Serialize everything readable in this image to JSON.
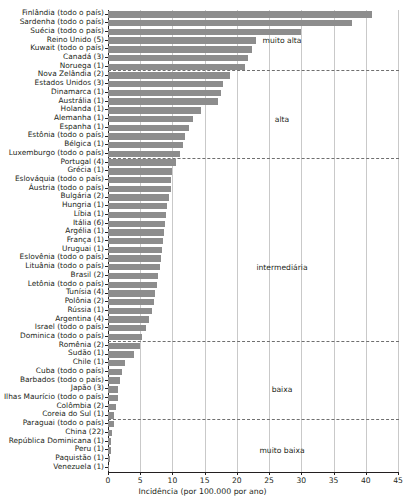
{
  "chart_data": {
    "type": "bar",
    "orientation": "horizontal",
    "title": "",
    "xlabel": "Incidência (por 100.000 por ano)",
    "ylabel": "",
    "xlim": [
      0,
      45
    ],
    "xticks": [
      0,
      5,
      10,
      15,
      20,
      25,
      30,
      35,
      40,
      45
    ],
    "grid": true,
    "legend": false,
    "bar_color": "#8d8d8d",
    "categories": [
      "Finlândia (todo o país)",
      "Sardenha (todo o país)",
      "Suécia (todo o país)",
      "Reino Unido (5)",
      "Kuwait (todo o país)",
      "Canadá (3)",
      "Noruega (1)",
      "Nova Zelândia (2)",
      "Estados Unidos (3)",
      "Dinamarca (1)",
      "Austrália (1)",
      "Holanda (1)",
      "Alemanha (1)",
      "Espanha (1)",
      "Estônia (todo o país)",
      "Bélgica (1)",
      "Luxemburgo (todo o país)",
      "Portugal (4)",
      "Grécia (1)",
      "Eslováquia (todo o país)",
      "Áustria (todo o país)",
      "Bulgária (2)",
      "Hungria (1)",
      "Líbia (1)",
      "Itália (6)",
      "Argélia (1)",
      "França (1)",
      "Uruguai (1)",
      "Eslovênia (todo o país)",
      "Lituânia (todo o país)",
      "Brasil (2)",
      "Letônia (todo o país)",
      "Tunísia (4)",
      "Polônia (2)",
      "Rússia (1)",
      "Argentina (4)",
      "Israel (todo o país)",
      "Dominica (todo o país)",
      "Romênia (2)",
      "Sudão (1)",
      "Chile (1)",
      "Cuba (todo o país)",
      "Barbados (todo o país)",
      "Japão (3)",
      "Ilhas Maurício (todo o país)",
      "Colômbia (2)",
      "Coreia do Sul (1)",
      "Paraguai (todo o país)",
      "China (22)",
      "República Dominicana (1)",
      "Peru (1)",
      "Paquistão (1)",
      "Venezuela (1)"
    ],
    "values": [
      40.9,
      37.8,
      30.0,
      22.9,
      22.3,
      21.7,
      21.2,
      19.0,
      17.8,
      17.6,
      17.0,
      14.4,
      13.2,
      12.5,
      11.9,
      11.6,
      11.2,
      10.6,
      10.0,
      9.8,
      9.7,
      9.4,
      9.2,
      9.0,
      8.9,
      8.7,
      8.6,
      8.4,
      8.2,
      8.0,
      7.8,
      7.6,
      7.3,
      7.1,
      6.9,
      6.4,
      5.9,
      5.2,
      5.0,
      4.0,
      2.6,
      2.2,
      1.9,
      1.6,
      1.5,
      1.2,
      1.0,
      0.9,
      0.6,
      0.5,
      0.4,
      0.3,
      0.2
    ],
    "annotations": [
      {
        "label": "muito alta",
        "x": 27.0,
        "index_center": 3
      },
      {
        "label": "alta",
        "x": 27.0,
        "index_center": 12
      },
      {
        "label": "intermediária",
        "x": 27.0,
        "index_center": 29
      },
      {
        "label": "baixa",
        "x": 27.0,
        "index_center": 43
      },
      {
        "label": "muito baixa",
        "x": 27.0,
        "index_center": 50
      }
    ],
    "separators_after_index": [
      6,
      16,
      37,
      46
    ]
  }
}
